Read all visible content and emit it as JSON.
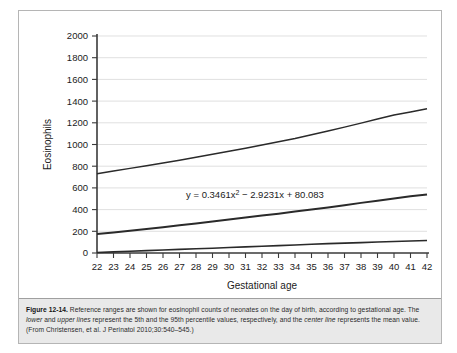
{
  "figure": {
    "number": "Figure 12-14.",
    "caption_part1": " Reference ranges are shown for eosinophil counts of neonates on the day of birth, according to gestational age. The ",
    "caption_ital1": "lower",
    "caption_part2": " and ",
    "caption_ital2": "upper lines",
    "caption_part3": " represent the 5th and the 95th percentile values, respectively, and the ",
    "caption_ital3": "center line",
    "caption_part4": " represents the mean value. (From Christensen, et al. J Perinatol 2010;30:540–545.)"
  },
  "chart_data": {
    "type": "line",
    "title": "",
    "xlabel": "Gestational age",
    "ylabel": "Eosinophils",
    "xlim": [
      22,
      42
    ],
    "ylim": [
      0,
      2000
    ],
    "grid": true,
    "legend": "none",
    "annotation": "y = 0.3461x² − 2.9231x + 80.083",
    "annotation_text": "y = 0.3461x",
    "annotation_exp": "2",
    "annotation_rest": " − 2.9231x + 80.083",
    "xticks": [
      22,
      23,
      24,
      25,
      26,
      27,
      28,
      29,
      30,
      31,
      32,
      33,
      34,
      35,
      36,
      37,
      38,
      39,
      40,
      41,
      42
    ],
    "yticks": [
      0,
      200,
      400,
      600,
      800,
      1000,
      1200,
      1400,
      1600,
      1800,
      2000
    ],
    "x": [
      22,
      23,
      24,
      25,
      26,
      27,
      28,
      29,
      30,
      31,
      32,
      33,
      34,
      35,
      36,
      37,
      38,
      39,
      40,
      41,
      42
    ],
    "series": [
      {
        "name": "95th percentile (upper line)",
        "color": "#2a2a2a",
        "width": 1.5,
        "values": [
          730,
          755,
          780,
          805,
          830,
          855,
          882,
          910,
          938,
          965,
          995,
          1025,
          1055,
          1090,
          1125,
          1160,
          1197,
          1235,
          1272,
          1300,
          1330
        ]
      },
      {
        "name": "Mean (center line)",
        "color": "#1c1c1c",
        "width": 2.0,
        "values": [
          176,
          190,
          205,
          221,
          238,
          255,
          272,
          290,
          308,
          327,
          345,
          362,
          382,
          400,
          420,
          440,
          462,
          482,
          503,
          522,
          540
        ]
      },
      {
        "name": "5th percentile (lower line)",
        "color": "#4a4a4a",
        "width": 1.6,
        "values": [
          5,
          10,
          16,
          22,
          28,
          33,
          39,
          44,
          50,
          56,
          62,
          68,
          74,
          80,
          86,
          91,
          96,
          101,
          106,
          111,
          115
        ]
      }
    ]
  }
}
